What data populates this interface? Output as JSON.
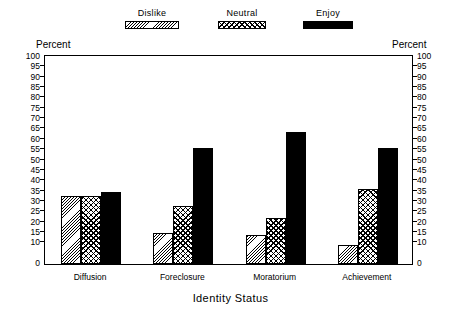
{
  "chart_data": {
    "type": "bar",
    "title": "",
    "xlabel": "Identity Status",
    "ylabel": "Percent",
    "ylabel_right": "Percent",
    "categories": [
      "Diffusion",
      "Foreclosure",
      "Moratorium",
      "Achievement"
    ],
    "series": [
      {
        "name": "Dislike",
        "pattern": "diagonal-hatch",
        "values": [
          33,
          15,
          14,
          9
        ]
      },
      {
        "name": "Neutral",
        "pattern": "checkerboard",
        "values": [
          33,
          28,
          22,
          36
        ]
      },
      {
        "name": "Enjoy",
        "pattern": "solid-black",
        "values": [
          35,
          56,
          64,
          56
        ]
      }
    ],
    "ylim": [
      0,
      100
    ],
    "yticks": [
      0,
      10,
      15,
      20,
      25,
      30,
      35,
      40,
      45,
      50,
      55,
      60,
      65,
      70,
      75,
      80,
      85,
      90,
      95,
      100
    ],
    "ytick_labels": [
      "0",
      "10",
      "15",
      "20",
      "25",
      "30",
      "35",
      "40",
      "45",
      "50",
      "55",
      "60",
      "65",
      "70",
      "75",
      "80",
      "85",
      "90",
      "95",
      "100"
    ],
    "grid": false,
    "legend_position": "top"
  },
  "colors": {
    "ink": "#000000",
    "paper": "#ffffff"
  }
}
